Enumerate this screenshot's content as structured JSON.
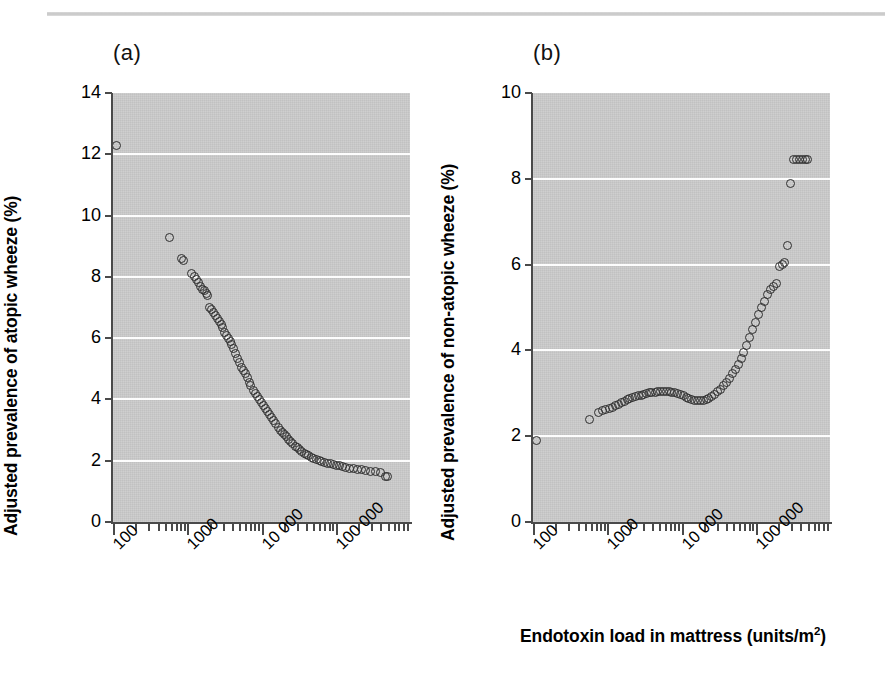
{
  "figure": {
    "top_rule": true,
    "background_color": "#ffffff",
    "plot_background_color": "#c9c9c9",
    "marker_color": "#2f2f2f",
    "gridline_color": "#fdfdfd",
    "axis_color": "#4a4a4a",
    "xaxis_caption": "Endotoxin load in mattress (units/m",
    "xaxis_caption_sup": "2",
    "xaxis_caption_tail": ")"
  },
  "panels": [
    {
      "letter": "(a)",
      "ylabel": "Adjusted prevalence of atopic wheeze (%)",
      "yticks": [
        "0",
        "2",
        "4",
        "6",
        "8",
        "10",
        "12",
        "14"
      ],
      "xticks": [
        "100",
        "1000",
        "10 000",
        "100 000"
      ]
    },
    {
      "letter": "(b)",
      "ylabel": "Adjusted prevalence of non-atopic wheeze (%)",
      "yticks": [
        "0",
        "2",
        "4",
        "6",
        "8",
        "10"
      ],
      "xticks": [
        "100",
        "1000",
        "10 000",
        "100 000"
      ]
    }
  ],
  "chart_data": [
    {
      "type": "scatter",
      "panel": "(a)",
      "title": "(a)",
      "xlabel": "Endotoxin load in mattress (units/m2)",
      "ylabel": "Adjusted prevalence of atopic wheeze (%)",
      "xscale": "log",
      "xlim": [
        100,
        1000000
      ],
      "ylim": [
        0,
        14
      ],
      "ytick_values": [
        0,
        2,
        4,
        6,
        8,
        10,
        12,
        14
      ],
      "xtick_values": [
        100,
        1000,
        10000,
        100000
      ],
      "xtick_labels": [
        "100",
        "1000",
        "10 000",
        "100 000"
      ],
      "grid": "horizontal-white-at-ytick",
      "legend": "none",
      "x": [
        110,
        570,
        830,
        900,
        1150,
        1250,
        1330,
        1420,
        1520,
        1620,
        1700,
        1800,
        1900,
        2000,
        2100,
        2250,
        2400,
        2560,
        2700,
        2850,
        3000,
        3200,
        3400,
        3600,
        3800,
        4000,
        4250,
        4500,
        4800,
        5100,
        5400,
        5700,
        6000,
        6400,
        6800,
        7200,
        7700,
        8200,
        8700,
        9300,
        9900,
        10600,
        11300,
        12000,
        12800,
        13700,
        14600,
        15600,
        16700,
        17800,
        19000,
        20300,
        21700,
        23200,
        24800,
        26500,
        28400,
        30400,
        32600,
        35000,
        37600,
        40500,
        43600,
        47000,
        50800,
        55000,
        59600,
        64700,
        70400,
        76800,
        84000,
        92000,
        101000,
        111000,
        123000,
        137000,
        153000,
        172000,
        194000,
        220000,
        252000,
        291000,
        338000,
        396000,
        470000,
        500000
      ],
      "y": [
        12.3,
        9.3,
        8.6,
        8.55,
        8.1,
        8.0,
        7.9,
        7.8,
        7.7,
        7.6,
        7.55,
        7.45,
        7.4,
        7.0,
        6.95,
        6.85,
        6.75,
        6.65,
        6.55,
        6.45,
        6.35,
        6.2,
        6.1,
        6.0,
        5.9,
        5.8,
        5.65,
        5.5,
        5.35,
        5.2,
        5.05,
        4.95,
        4.85,
        4.7,
        4.55,
        4.45,
        4.3,
        4.2,
        4.1,
        4.0,
        3.9,
        3.8,
        3.7,
        3.6,
        3.5,
        3.4,
        3.3,
        3.2,
        3.1,
        3.0,
        2.92,
        2.85,
        2.78,
        2.7,
        2.62,
        2.55,
        2.48,
        2.42,
        2.36,
        2.3,
        2.25,
        2.2,
        2.16,
        2.12,
        2.08,
        2.04,
        2.0,
        1.97,
        1.94,
        1.92,
        1.9,
        1.88,
        1.85,
        1.83,
        1.8,
        1.78,
        1.76,
        1.74,
        1.72,
        1.7,
        1.68,
        1.66,
        1.64,
        1.63,
        1.5,
        1.48
      ]
    },
    {
      "type": "scatter",
      "panel": "(b)",
      "title": "(b)",
      "xlabel": "Endotoxin load in mattress (units/m2)",
      "ylabel": "Adjusted prevalence of non-atopic wheeze (%)",
      "xscale": "log",
      "xlim": [
        100,
        1000000
      ],
      "ylim": [
        0,
        10
      ],
      "ytick_values": [
        0,
        2,
        4,
        6,
        8,
        10
      ],
      "xtick_values": [
        100,
        1000,
        10000,
        100000
      ],
      "xtick_labels": [
        "100",
        "1000",
        "10 000",
        "100 000"
      ],
      "grid": "horizontal-white-at-ytick",
      "legend": "none",
      "x": [
        110,
        570,
        760,
        850,
        950,
        1060,
        1180,
        1300,
        1420,
        1550,
        1700,
        1850,
        2000,
        2200,
        2400,
        2600,
        2850,
        3100,
        3400,
        3700,
        4000,
        4400,
        4800,
        5200,
        5700,
        6200,
        6800,
        7400,
        8100,
        8800,
        9600,
        10500,
        11500,
        12500,
        13700,
        15000,
        16400,
        17900,
        19600,
        21400,
        23400,
        25600,
        28000,
        30600,
        33500,
        36700,
        40200,
        44000,
        48200,
        52800,
        57800,
        63300,
        69300,
        75900,
        83100,
        91000,
        99600,
        109000,
        119000,
        131000,
        143000,
        157000,
        172000,
        188000,
        206000,
        226000,
        247000,
        271000,
        297000,
        325000,
        356000,
        390000,
        427000,
        468000,
        500000
      ],
      "y": [
        1.9,
        2.4,
        2.55,
        2.6,
        2.62,
        2.65,
        2.68,
        2.72,
        2.75,
        2.78,
        2.82,
        2.85,
        2.88,
        2.9,
        2.92,
        2.94,
        2.96,
        2.98,
        3.0,
        3.01,
        3.02,
        3.03,
        3.04,
        3.05,
        3.05,
        3.05,
        3.04,
        3.03,
        3.02,
        3.0,
        2.97,
        2.94,
        2.91,
        2.88,
        2.86,
        2.84,
        2.83,
        2.83,
        2.84,
        2.86,
        2.89,
        2.93,
        2.98,
        3.04,
        3.1,
        3.18,
        3.26,
        3.35,
        3.45,
        3.56,
        3.68,
        3.82,
        3.96,
        4.12,
        4.3,
        4.48,
        4.66,
        4.84,
        5.0,
        5.15,
        5.3,
        5.42,
        5.5,
        5.55,
        5.95,
        6.0,
        6.05,
        6.45,
        7.9,
        8.45,
        8.45,
        8.45,
        8.45,
        8.45,
        8.45
      ]
    }
  ]
}
